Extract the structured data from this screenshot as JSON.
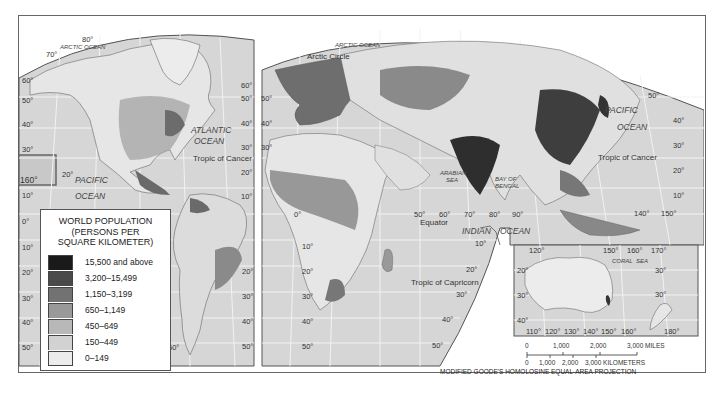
{
  "map": {
    "title": "WORLD POPULATION",
    "projection": "MODIFIED GOODE'S HOMOLOSINE EQUAL-AREA PROJECTION",
    "colors": {
      "ocean": "#d6d6d6",
      "gridline": "#f2f2f2",
      "land_low": "#ececec",
      "border": "#666666"
    },
    "ocean_labels": {
      "arctic_ocean_west": "ARCTIC OCEAN",
      "arctic_ocean_east": "ARCTIC OCEAN",
      "atlantic_1": "ATLANTIC",
      "atlantic_2": "OCEAN",
      "pacific_west_1": "PACIFIC",
      "pacific_west_2": "OCEAN",
      "pacific_east_1": "PACIFIC",
      "pacific_east_2": "OCEAN",
      "arabian_1": "ARABIAN",
      "arabian_2": "SEA",
      "bengal_1": "BAY OF",
      "bengal_2": "BENGAL",
      "indian_1": "INDIAN",
      "indian_2": "OCEAN",
      "coral_1": "CORAL",
      "coral_2": "SEA"
    },
    "lines": {
      "arctic_circle": "Arctic Circle",
      "tropic_cancer_west": "Tropic of Cancer",
      "tropic_cancer_east": "Tropic of Cancer",
      "equator": "Equator",
      "tropic_capricorn": "Tropic of Capricorn"
    },
    "degrees": {
      "west_lat": [
        "60°",
        "50°",
        "40°",
        "30°",
        "20°",
        "10°",
        "0°",
        "10°",
        "20°",
        "30°",
        "40°",
        "50°"
      ],
      "west_top": [
        "80°",
        "70°"
      ],
      "hawaii": "160°",
      "mid_lat": [
        "60°",
        "50°",
        "40°",
        "30°",
        "20°",
        "10°"
      ],
      "sa_right": [
        "10°",
        "20°",
        "30°",
        "40°",
        "50°"
      ],
      "africa_left": [
        "50°",
        "40°",
        "30°",
        "10°",
        "20°",
        "30°",
        "40°",
        "50°"
      ],
      "sa_bottom": "50°",
      "zero_lon": "0°",
      "equator_lons": [
        "50°",
        "60°",
        "70°",
        "80°",
        "90°"
      ],
      "indian_lat": [
        "10°",
        "20°",
        "30°",
        "40°",
        "50°"
      ],
      "east_lat": [
        "50°",
        "40°",
        "30°",
        "20°",
        "10°"
      ],
      "east_lons": [
        "140°",
        "150°"
      ],
      "aus_top": [
        "120°",
        "150°",
        "160°",
        "170°"
      ],
      "aus_left": [
        "20°",
        "30°",
        "40°"
      ],
      "aus_right": [
        "30°",
        "30°"
      ],
      "aus_bottom": [
        "110°",
        "120°",
        "130°",
        "140°",
        "150°",
        "160°",
        "180°"
      ]
    }
  },
  "legend": {
    "title_1": "WORLD POPULATION",
    "title_2": "(PERSONS PER",
    "title_3": "SQUARE KILOMETER)",
    "items": [
      {
        "label": "15,500 and above",
        "color": "#1a1a1a"
      },
      {
        "label": "3,200–15,499",
        "color": "#4a4a4a"
      },
      {
        "label": "1,150–3,199",
        "color": "#727272"
      },
      {
        "label": "650–1,149",
        "color": "#999999"
      },
      {
        "label": "450–649",
        "color": "#b8b8b8"
      },
      {
        "label": "150–449",
        "color": "#d2d2d2"
      },
      {
        "label": "0–149",
        "color": "#ececec"
      }
    ]
  },
  "scale": {
    "miles_ticks": [
      "0",
      "1,000",
      "2,000",
      "3,000 MILES"
    ],
    "km_ticks": [
      "0",
      "1,000",
      "2,000",
      "3,000 KILOMETERS"
    ]
  }
}
